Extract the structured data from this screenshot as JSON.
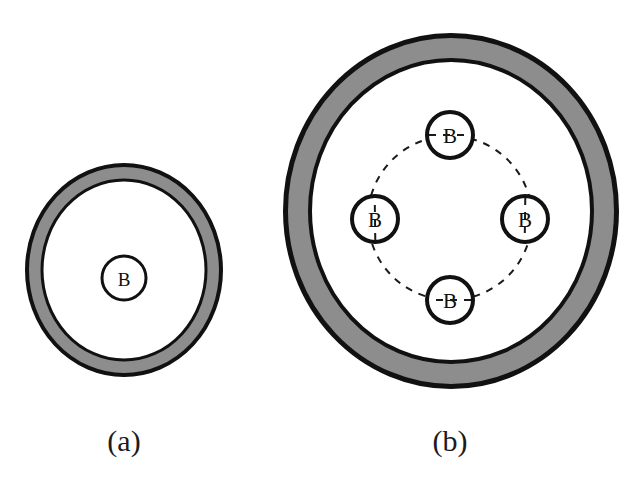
{
  "figure": {
    "background_color": "#ffffff",
    "ring_fill_color": "#8d8d8d",
    "ring_stroke_color": "#111111",
    "interior_fill_color": "#ffffff",
    "dashed_stroke_color": "#1a1a1a",
    "label_color": "#101010"
  },
  "panels": [
    {
      "id": "panel-a",
      "caption": "(a)",
      "caption_x": 124,
      "caption_y": 451,
      "shell": {
        "cx": 124,
        "cy": 270,
        "outer_rx": 99,
        "outer_ry": 107,
        "gray_band_width": 13,
        "outer_stroke_width": 4,
        "inner_stroke_width": 3
      },
      "dashed_circle": null,
      "beads": [
        {
          "label": "B",
          "cx": 124,
          "cy": 278,
          "r": 22,
          "stroke_width": 3,
          "font_size": 19
        }
      ]
    },
    {
      "id": "panel-b",
      "caption": "(b)",
      "caption_x": 450,
      "caption_y": 451,
      "shell": {
        "cx": 451,
        "cy": 211,
        "outer_rx": 168,
        "outer_ry": 178,
        "gray_band_width": 22,
        "outer_stroke_width": 5,
        "inner_stroke_width": 4
      },
      "dashed_circle": {
        "cx": 450,
        "cy": 218,
        "r": 82,
        "stroke_width": 2,
        "dash_pattern": "7 7"
      },
      "beads": [
        {
          "label": "B",
          "cx": 450,
          "cy": 135,
          "r": 23,
          "stroke_width": 4,
          "font_size": 21
        },
        {
          "label": "B",
          "cx": 375,
          "cy": 219,
          "r": 23,
          "stroke_width": 4,
          "font_size": 21
        },
        {
          "label": "B",
          "cx": 525,
          "cy": 219,
          "r": 23,
          "stroke_width": 4,
          "font_size": 21
        },
        {
          "label": "B",
          "cx": 450,
          "cy": 300,
          "r": 23,
          "stroke_width": 4,
          "font_size": 21
        }
      ]
    }
  ]
}
